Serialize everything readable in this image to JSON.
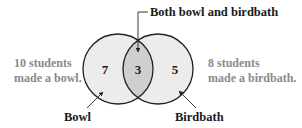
{
  "diagram": {
    "type": "venn",
    "sets": [
      {
        "name": "Bowl",
        "label": "Bowl",
        "only_count": "7",
        "total_text_line1": "10 students",
        "total_text_line2": "made a bowl."
      },
      {
        "name": "Birdbath",
        "label": "Birdbath",
        "only_count": "5",
        "total_text_line1": "8 students",
        "total_text_line2": "made a birdbath."
      }
    ],
    "intersection": {
      "label": "Both bowl and birdbath",
      "count": "3"
    },
    "colors": {
      "circle_fill": "#ececec",
      "intersection_fill": "#cfcfcf",
      "outline": "#222222",
      "side_text": "#8a8a8a",
      "label_text": "#1a1a1a"
    }
  }
}
